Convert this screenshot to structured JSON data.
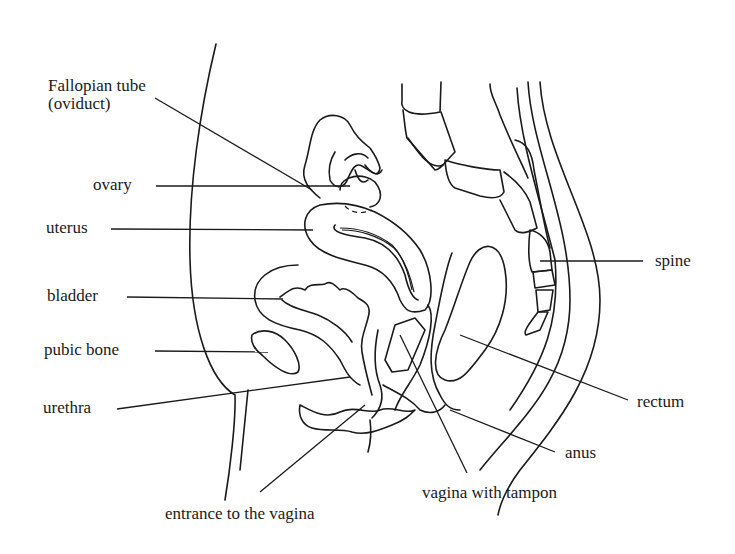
{
  "diagram": {
    "type": "anatomical-cross-section",
    "colors": {
      "line": "#1a1a1a",
      "background": "#ffffff"
    }
  },
  "labels": {
    "fallopian_tube_line1": "Fallopian tube",
    "fallopian_tube_line2": "(oviduct)",
    "ovary": "ovary",
    "uterus": "uterus",
    "bladder": "bladder",
    "pubic_bone": "pubic bone",
    "urethra": "urethra",
    "entrance_to_vagina": "entrance to the vagina",
    "vagina_with_tampon": "vagina with tampon",
    "anus": "anus",
    "rectum": "rectum",
    "spine": "spine"
  }
}
